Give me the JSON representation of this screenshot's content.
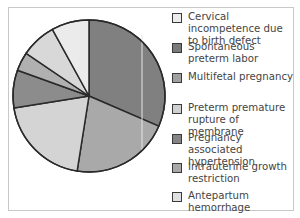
{
  "chart_data": {
    "type": "pie",
    "title": "",
    "start_angle_deg": 0,
    "direction": "clockwise",
    "legend_position": "right",
    "slices": [
      {
        "label": "Spontaneous preterm labor",
        "value": 31.5,
        "color": "#808080"
      },
      {
        "label": "Multifetal pregnancy",
        "value": 21,
        "color": "#a9a9a9"
      },
      {
        "label": "Preterm premature rupture of membrane",
        "value": 20,
        "color": "#d4d4d4"
      },
      {
        "label": "Pregnancy associated hypertension",
        "value": 8,
        "color": "#8c8c8c"
      },
      {
        "label": "Intrauterine growth restriction",
        "value": 4,
        "color": "#b0b0b0"
      },
      {
        "label": "Antepartum hemorrhage",
        "value": 7.5,
        "color": "#d8d8d8"
      },
      {
        "label": "Cervical incompetence due to birth defect",
        "value": 8,
        "color": "#ebebeb"
      }
    ]
  },
  "legend": {
    "items": [
      {
        "label": "Cervical incompetence due to birth defect",
        "color": "#ebebeb"
      },
      {
        "label": "Spontaneous preterm labor",
        "color": "#7a7a7a"
      },
      {
        "label": "Multifetal pregnancy",
        "color": "#a0a0a0"
      },
      {
        "label": "Preterm premature rupture of membrane",
        "color": "#d0d0d0"
      },
      {
        "label": "Pregnancy associated hypertension",
        "color": "#858585"
      },
      {
        "label": "Intrauterine growth restriction",
        "color": "#a8a8a8"
      },
      {
        "label": "Antepartum hemorrhage",
        "color": "#e0e0e0"
      }
    ]
  }
}
